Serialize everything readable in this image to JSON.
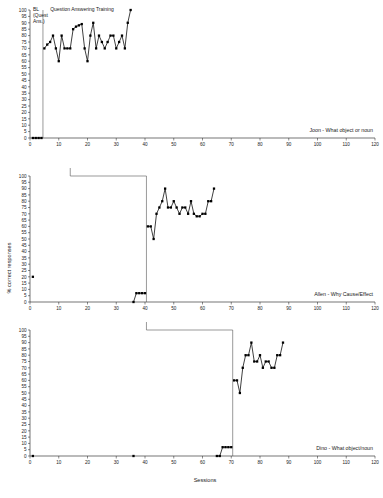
{
  "figure": {
    "axis_titles": {
      "x": "Sessions",
      "y": "% correct responses"
    },
    "x_axis": {
      "min": 0,
      "max": 120,
      "tick_step": 10,
      "ticks": [
        0,
        10,
        20,
        30,
        40,
        50,
        60,
        70,
        80,
        90,
        100,
        110,
        120
      ]
    },
    "y_axis": {
      "min": 0,
      "max": 100,
      "tick_step": 5,
      "ticks": [
        0,
        5,
        10,
        15,
        20,
        25,
        30,
        35,
        40,
        45,
        50,
        55,
        60,
        65,
        70,
        75,
        80,
        85,
        90,
        95,
        100
      ]
    },
    "colors": {
      "line": "#000000",
      "marker": "#000000",
      "axis": "#1a1a1a",
      "phase_line": "#555555",
      "background": "#ffffff"
    }
  },
  "chart_data": {
    "type": "line",
    "title": "",
    "subtitle": "",
    "xlabel": "Sessions",
    "ylabel": "% correct responses",
    "xlim": [
      0,
      120
    ],
    "ylim": [
      0,
      100
    ],
    "grid": false,
    "legend_position": "none",
    "panels": [
      {
        "id": "panel-joon",
        "caption": "Joon - What object or noun",
        "phase_labels": [
          {
            "text": "BL (Quest Ans.)",
            "x": 1.0,
            "y": 99
          },
          {
            "text": "Question Answering Training",
            "x": 7.0,
            "y": 99
          }
        ],
        "phase_lines": [
          {
            "x": 4.5,
            "y_from": 0,
            "y_to": 100
          }
        ],
        "series": [
          {
            "name": "Baseline (Quest Ans.)",
            "x": [
              1,
              2,
              3,
              4
            ],
            "values": [
              0,
              0,
              0,
              0
            ]
          },
          {
            "name": "Question Answering Training",
            "x": [
              5,
              6,
              7,
              8,
              9,
              10,
              11,
              12,
              13,
              14,
              15,
              16,
              17,
              18,
              19,
              20,
              21,
              22,
              23,
              24,
              25,
              26,
              27,
              28,
              29,
              30,
              31,
              32,
              33,
              34,
              35
            ],
            "values": [
              70,
              73,
              75,
              80,
              70,
              60,
              80,
              70,
              70,
              70,
              85,
              87,
              88,
              89,
              70,
              60,
              80,
              90,
              70,
              80,
              75,
              70,
              75,
              80,
              80,
              70,
              75,
              80,
              70,
              90,
              100
            ]
          }
        ]
      },
      {
        "id": "panel-allen",
        "caption": "Allen - Why Cause/Effect",
        "phase_labels": [],
        "phase_lines": [
          {
            "x": 40.5,
            "y_from": 0,
            "y_to": 100
          }
        ],
        "bracket": {
          "x_from": 14,
          "x_to": 40.5,
          "y": 100
        },
        "series": [
          {
            "name": "Probe",
            "x": [
              1
            ],
            "values": [
              20
            ]
          },
          {
            "name": "Baseline",
            "x": [
              36,
              37,
              38,
              39,
              40
            ],
            "values": [
              0,
              7,
              7,
              7,
              7
            ]
          },
          {
            "name": "Why Cause/Effect Training",
            "x": [
              41,
              42,
              43,
              44,
              45,
              46,
              47,
              48,
              49,
              50,
              51,
              52,
              53,
              54,
              55,
              56,
              57,
              58,
              59,
              60,
              61,
              62,
              63,
              64
            ],
            "values": [
              60,
              60,
              50,
              70,
              75,
              80,
              90,
              75,
              75,
              80,
              75,
              70,
              75,
              75,
              70,
              80,
              70,
              68,
              68,
              70,
              70,
              80,
              80,
              90
            ]
          }
        ]
      },
      {
        "id": "panel-dino",
        "caption": "Dino - What object/noun",
        "phase_labels": [],
        "phase_lines": [
          {
            "x": 70.5,
            "y_from": 0,
            "y_to": 100
          }
        ],
        "bracket": {
          "x_from": 40.5,
          "x_to": 70.5,
          "y": 100
        },
        "series": [
          {
            "name": "Probe 1",
            "x": [
              1
            ],
            "values": [
              0
            ]
          },
          {
            "name": "Probe 2",
            "x": [
              36
            ],
            "values": [
              0
            ]
          },
          {
            "name": "Baseline",
            "x": [
              65,
              66,
              67,
              68,
              69,
              70
            ],
            "values": [
              0,
              0,
              7,
              7,
              7,
              7
            ]
          },
          {
            "name": "What object/noun Training",
            "x": [
              71,
              72,
              73,
              74,
              75,
              76,
              77,
              78,
              79,
              80,
              81,
              82,
              83,
              84,
              85,
              86,
              87,
              88
            ],
            "values": [
              60,
              60,
              50,
              70,
              80,
              80,
              90,
              75,
              75,
              80,
              70,
              75,
              75,
              70,
              70,
              80,
              80,
              90
            ]
          }
        ]
      }
    ]
  }
}
